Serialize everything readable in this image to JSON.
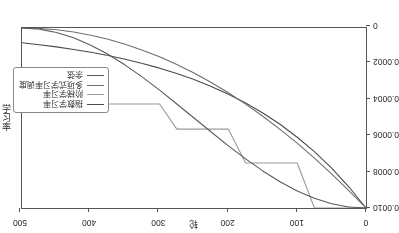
{
  "chart_data": {
    "type": "line",
    "title": "",
    "xlabel": "轮",
    "ylabel": "学习率",
    "xlim": [
      0,
      500
    ],
    "ylim": [
      0,
      0.001
    ],
    "grid": false,
    "legend_position": "lower left",
    "xticks": [
      0,
      100,
      200,
      300,
      400,
      500
    ],
    "xtick_labels": [
      "0",
      "100",
      "200",
      "300",
      "400",
      "500"
    ],
    "yticks": [
      0,
      0.0002,
      0.0004,
      0.0006,
      0.0008,
      0.001
    ],
    "ytick_labels": [
      "0",
      "0.0002",
      "0.0004",
      "0.0006",
      "0.0008",
      "0.0010"
    ],
    "x": [
      0,
      25,
      50,
      75,
      100,
      125,
      150,
      175,
      200,
      225,
      250,
      275,
      300,
      325,
      350,
      375,
      400,
      425,
      450,
      475,
      500
    ],
    "series": [
      {
        "name": "指数学习率",
        "color": "#4a4a4a",
        "values": [
          0.001,
          0.000882,
          0.000779,
          0.000687,
          0.000607,
          0.000535,
          0.000472,
          0.000417,
          0.000368,
          0.000325,
          0.000286,
          0.000253,
          0.000223,
          0.000197,
          0.000174,
          0.000153,
          0.000135,
          0.000119,
          0.000105,
          9.3e-05,
          8.2e-05
        ]
      },
      {
        "name": "阶梯学习率",
        "color": "#9a9a9a",
        "values": [
          0.001,
          0.001,
          0.001,
          0.001,
          0.00075,
          0.00075,
          0.00075,
          0.00075,
          0.000562,
          0.000562,
          0.000562,
          0.000562,
          0.000422,
          0.000422,
          0.000422,
          0.000422,
          0.000316,
          0.000316,
          0.000316,
          0.000316,
          0.000316
        ]
      },
      {
        "name": "多项式学习率调度",
        "color": "#6e6e6e",
        "values": [
          0.001,
          0.000903,
          0.00081,
          0.000723,
          0.00064,
          0.000563,
          0.00049,
          0.000423,
          0.00036,
          0.000303,
          0.00025,
          0.000203,
          0.00016,
          0.000123,
          9e-05,
          6.25e-05,
          4e-05,
          2.25e-05,
          1e-05,
          2.5e-06,
          0.0
        ]
      },
      {
        "name": "余弦",
        "color": "#5a5a5a",
        "values": [
          0.001,
          0.000994,
          0.000976,
          0.000946,
          0.000905,
          0.000854,
          0.000794,
          0.000727,
          0.000655,
          0.000578,
          0.0005,
          0.000422,
          0.000345,
          0.000273,
          0.000206,
          0.000146,
          9.55e-05,
          5.45e-05,
          2.45e-05,
          6.2e-06,
          0.0
        ]
      }
    ]
  },
  "legend": {
    "items": [
      {
        "label": "指数学习率",
        "color": "#4a4a4a"
      },
      {
        "label": "阶梯学习率",
        "color": "#9a9a9a"
      },
      {
        "label": "多项式学习率调度",
        "color": "#6e6e6e"
      },
      {
        "label": "余弦",
        "color": "#5a5a5a"
      }
    ]
  }
}
